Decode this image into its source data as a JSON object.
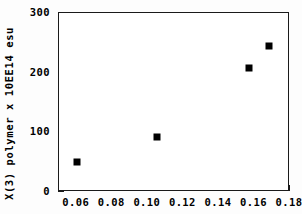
{
  "chart_data": {
    "type": "scatter",
    "title": "",
    "xlabel": "",
    "ylabel": "X(3)  polymer  x  10EE14  esu",
    "xlim": [
      0.05,
      0.18
    ],
    "ylim": [
      0,
      300
    ],
    "grid": false,
    "legend": null,
    "marker": "filled-square",
    "marker_color": "#000000",
    "x": [
      0.06,
      0.105,
      0.157,
      0.168
    ],
    "y": [
      50,
      93,
      208,
      244
    ],
    "points": [
      {
        "x": 0.06,
        "y": 50
      },
      {
        "x": 0.105,
        "y": 93
      },
      {
        "x": 0.157,
        "y": 208
      },
      {
        "x": 0.168,
        "y": 244
      }
    ],
    "xticks": [
      {
        "value": 0.06,
        "label": "0.06"
      },
      {
        "value": 0.08,
        "label": "0.08"
      },
      {
        "value": 0.1,
        "label": "0.10"
      },
      {
        "value": 0.12,
        "label": "0.12"
      },
      {
        "value": 0.14,
        "label": "0.14"
      },
      {
        "value": 0.16,
        "label": "0.16"
      },
      {
        "value": 0.18,
        "label": "0.18"
      }
    ],
    "xticks_minor": [
      0.05,
      0.07,
      0.09,
      0.11,
      0.13,
      0.15,
      0.17
    ],
    "yticks": [
      {
        "value": 0,
        "label": "0"
      },
      {
        "value": 100,
        "label": "100"
      },
      {
        "value": 200,
        "label": "200"
      },
      {
        "value": 300,
        "label": "300"
      }
    ],
    "yticks_minor": [
      50,
      150,
      250
    ]
  },
  "axes": {
    "frame_color": "#1a1a1a"
  }
}
